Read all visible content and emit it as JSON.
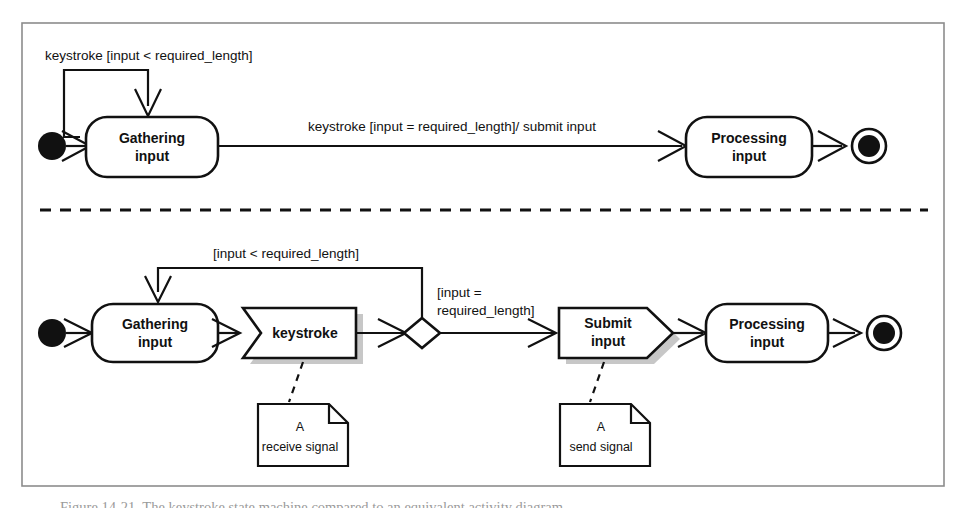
{
  "figure": {
    "caption": "Figure 14-21. The keystroke state machine compared to an equivalent activity diagram",
    "frame_color": "#8c8c8c",
    "ink_color": "#111111",
    "shadow_color": "#bdbdbd"
  },
  "top_diagram": {
    "kind": "state-machine",
    "initial_state_label": "initial-state",
    "final_state_label": "final-state",
    "states": [
      {
        "id": "gathering",
        "line1": "Gathering",
        "line2": "input"
      },
      {
        "id": "processing",
        "line1": "Processing",
        "line2": "input"
      }
    ],
    "transitions": [
      {
        "id": "self-loop",
        "label": "keystroke [input < required_length]"
      },
      {
        "id": "submit",
        "label": "keystroke [input = required_length]/ submit input"
      }
    ]
  },
  "bottom_diagram": {
    "kind": "activity-diagram",
    "initial_state_label": "initial-node",
    "final_state_label": "final-node",
    "states": [
      {
        "id": "gathering",
        "line1": "Gathering",
        "line2": "input"
      },
      {
        "id": "processing",
        "line1": "Processing",
        "line2": "input"
      }
    ],
    "signals": [
      {
        "id": "keystroke",
        "label": "keystroke",
        "shape": "receive-signal"
      },
      {
        "id": "submit",
        "line1": "Submit",
        "line2": "input",
        "shape": "send-signal"
      }
    ],
    "decision_label": "decision-diamond",
    "guards": [
      {
        "id": "loop-guard",
        "label": "[input < required_length]"
      },
      {
        "id": "branch-guard-line1",
        "label": "[input ="
      },
      {
        "id": "branch-guard-line2",
        "label": "required_length]"
      }
    ],
    "notes": [
      {
        "id": "receive-note",
        "line1": "A",
        "line2": "receive signal"
      },
      {
        "id": "send-note",
        "line1": "A",
        "line2": "send signal"
      }
    ]
  }
}
